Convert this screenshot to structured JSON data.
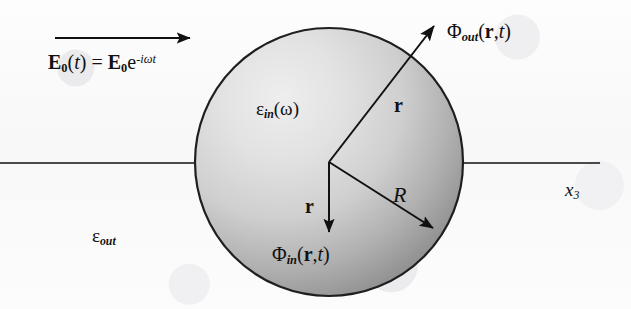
{
  "figure": {
    "background_color": "#fcfcfc",
    "line_color": "#111111"
  },
  "sphere": {
    "center_x": 329,
    "center_y": 162,
    "radius": 134,
    "fill_light": "#ebebeb",
    "fill_dark": "#8d8d8d",
    "outline_color": "#1a1a1a",
    "interior_permittivity": {
      "symbol": "ε",
      "subscript": "in",
      "argument": "ω",
      "full": "εin(ω)"
    },
    "exterior_permittivity": {
      "symbol": "ε",
      "subscript": "out",
      "full": "εout"
    }
  },
  "incident_field": {
    "arrow_label_lhs_symbol": "E",
    "arrow_label_lhs_sub": "0",
    "arrow_label_arg": "(t)",
    "equals": "=",
    "rhs_symbol": "E",
    "rhs_sub": "0",
    "rhs_base": "e",
    "rhs_exponent": "-iωt",
    "full": "E0(t) = E0e-iωt",
    "arrow_x_start": 55,
    "arrow_x_end": 193,
    "arrow_y": 38,
    "direction": "left-to-right"
  },
  "axis": {
    "label": "x",
    "subscript": "3",
    "full": "x3",
    "y": 163,
    "x_start": 0,
    "x_end": 600
  },
  "potentials": {
    "outside": {
      "symbol": "Φ",
      "subscript": "out",
      "args_vector": "r",
      "args_time": "t",
      "full": "Φout(r,t)",
      "arrow_from": [
        329,
        162
      ],
      "arrow_to": [
        438,
        22
      ]
    },
    "inside": {
      "symbol": "Φ",
      "subscript": "in",
      "args_vector": "r",
      "args_time": "t",
      "full": "Φin(r,t)",
      "arrow_from": [
        329,
        162
      ],
      "arrow_to": [
        329,
        236
      ]
    }
  },
  "vectors": {
    "r_upper_label": "r",
    "r_lower_label": "r",
    "radius_label": "R",
    "radius_arrow_from": [
      329,
      162
    ],
    "radius_arrow_to": [
      437,
      231
    ]
  }
}
